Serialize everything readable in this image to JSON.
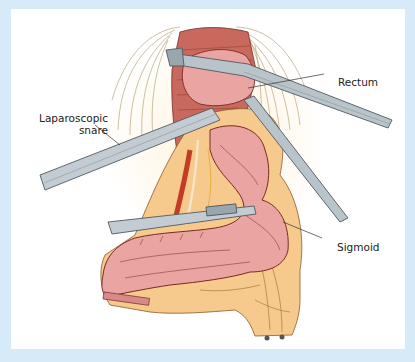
{
  "figure": {
    "labels": {
      "rectum": "Rectum",
      "snare_line1": "Laparoscopic",
      "snare_line2": "snare",
      "sigmoid": "Sigmoid"
    },
    "colors": {
      "frame": "#d6eaf8",
      "panel": "#ffffff",
      "bowel": "#e8a0a0",
      "bowel_outline": "#8a3a3a",
      "mesentery": "#f6c98c",
      "vessel": "#c23b22",
      "instrument": "#b9c3ca",
      "instrument_edge": "#5e6a72",
      "muscle_lines": "#b0a078"
    }
  }
}
